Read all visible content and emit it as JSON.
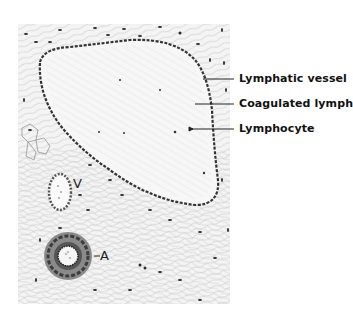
{
  "figure": {
    "type": "histology-illustration",
    "callouts": [
      {
        "id": "lymphatic-vessel",
        "label": "Lymphatic vessel"
      },
      {
        "id": "coagulated-lymph",
        "label": "Coagulated lymph"
      },
      {
        "id": "lymphocyte",
        "label": "Lymphocyte"
      }
    ],
    "inline_labels": {
      "vein": "V",
      "artery": "A"
    }
  }
}
